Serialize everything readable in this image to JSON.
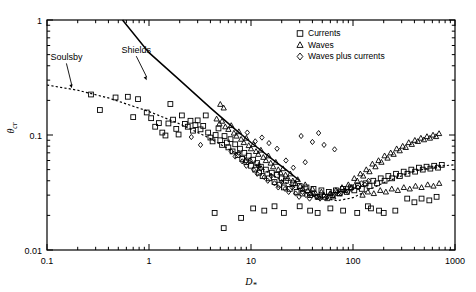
{
  "chart_data": {
    "type": "scatter",
    "title": "",
    "xlabel": "D*",
    "ylabel": "θcr",
    "xscale": "log",
    "yscale": "log",
    "xlim": [
      0.1,
      1000
    ],
    "ylim": [
      0.01,
      1
    ],
    "xticks": [
      "0.1",
      "1",
      "10",
      "100",
      "1000"
    ],
    "yticks": [
      "0.01",
      "0.1",
      "1"
    ],
    "grid": false,
    "legend_position": "top-right",
    "legend": [
      {
        "label": "Currents",
        "marker": "square"
      },
      {
        "label": "Waves",
        "marker": "triangle"
      },
      {
        "label": "Waves plus currents",
        "marker": "diamond"
      }
    ],
    "annotations": [
      {
        "text": "Shields",
        "x": 0.75,
        "y": 0.52,
        "arrow_to_x": 0.95,
        "arrow_to_y": 0.3
      },
      {
        "text": "Soulsby",
        "x": 0.155,
        "y": 0.45,
        "arrow_to_x": 0.175,
        "arrow_to_y": 0.255
      }
    ],
    "curves": [
      {
        "name": "Shields",
        "style": "solid",
        "points": [
          [
            0.55,
            1.0
          ],
          [
            1,
            0.52
          ],
          [
            2,
            0.3
          ],
          [
            4,
            0.172
          ],
          [
            7,
            0.112
          ],
          [
            10,
            0.086
          ],
          [
            16,
            0.062
          ],
          [
            22,
            0.05
          ],
          [
            30,
            0.04
          ]
        ]
      },
      {
        "name": "Soulsby",
        "style": "dotted",
        "points": [
          [
            0.1,
            0.272
          ],
          [
            0.2,
            0.245
          ],
          [
            0.4,
            0.21
          ],
          [
            0.7,
            0.178
          ],
          [
            1,
            0.16
          ],
          [
            2,
            0.125
          ],
          [
            4,
            0.093
          ],
          [
            7,
            0.07
          ],
          [
            10,
            0.059
          ],
          [
            20,
            0.04
          ],
          [
            40,
            0.0295
          ],
          [
            70,
            0.0268
          ],
          [
            100,
            0.0285
          ],
          [
            200,
            0.0385
          ],
          [
            400,
            0.0485
          ],
          [
            700,
            0.0535
          ],
          [
            1000,
            0.0552
          ]
        ]
      }
    ],
    "series": [
      {
        "name": "Currents",
        "marker": "square",
        "points": [
          [
            0.27,
            0.225
          ],
          [
            0.33,
            0.165
          ],
          [
            0.47,
            0.212
          ],
          [
            0.62,
            0.215
          ],
          [
            0.7,
            0.143
          ],
          [
            0.78,
            0.205
          ],
          [
            0.95,
            0.157
          ],
          [
            1.05,
            0.14
          ],
          [
            1.15,
            0.118
          ],
          [
            1.25,
            0.127
          ],
          [
            1.35,
            0.105
          ],
          [
            1.45,
            0.099
          ],
          [
            1.55,
            0.126
          ],
          [
            1.62,
            0.186
          ],
          [
            1.72,
            0.136
          ],
          [
            1.85,
            0.113
          ],
          [
            1.95,
            0.101
          ],
          [
            2.1,
            0.148
          ],
          [
            2.25,
            0.125
          ],
          [
            2.4,
            0.118
          ],
          [
            2.55,
            0.133
          ],
          [
            2.7,
            0.109
          ],
          [
            2.85,
            0.122
          ],
          [
            3.0,
            0.134
          ],
          [
            3.2,
            0.112
          ],
          [
            3.4,
            0.12
          ],
          [
            3.6,
            0.148
          ],
          [
            3.8,
            0.105
          ],
          [
            4.0,
            0.095
          ],
          [
            4.2,
            0.088
          ],
          [
            4.5,
            0.1
          ],
          [
            4.8,
            0.114
          ],
          [
            5.0,
            0.09
          ],
          [
            5.2,
            0.082
          ],
          [
            5.5,
            0.098
          ],
          [
            5.8,
            0.086
          ],
          [
            6.0,
            0.078
          ],
          [
            6.3,
            0.092
          ],
          [
            6.6,
            0.072
          ],
          [
            7.0,
            0.083
          ],
          [
            7.4,
            0.067
          ],
          [
            7.8,
            0.076
          ],
          [
            8.2,
            0.062
          ],
          [
            8.6,
            0.07
          ],
          [
            9.0,
            0.058
          ],
          [
            9.5,
            0.066
          ],
          [
            10,
            0.054
          ],
          [
            10.5,
            0.061
          ],
          [
            11,
            0.05
          ],
          [
            11.5,
            0.057
          ],
          [
            12,
            0.047
          ],
          [
            12.5,
            0.053
          ],
          [
            13,
            0.044
          ],
          [
            14,
            0.05
          ],
          [
            15,
            0.042
          ],
          [
            16,
            0.047
          ],
          [
            17,
            0.039
          ],
          [
            18,
            0.045
          ],
          [
            19,
            0.037
          ],
          [
            20,
            0.042
          ],
          [
            21,
            0.035
          ],
          [
            22,
            0.04
          ],
          [
            24,
            0.034
          ],
          [
            26,
            0.038
          ],
          [
            28,
            0.032
          ],
          [
            30,
            0.036
          ],
          [
            32,
            0.031
          ],
          [
            35,
            0.035
          ],
          [
            38,
            0.03
          ],
          [
            41,
            0.034
          ],
          [
            45,
            0.029
          ],
          [
            49,
            0.033
          ],
          [
            53,
            0.029
          ],
          [
            58,
            0.032
          ],
          [
            63,
            0.03
          ],
          [
            68,
            0.033
          ],
          [
            74,
            0.031
          ],
          [
            80,
            0.034
          ],
          [
            87,
            0.032
          ],
          [
            95,
            0.035
          ],
          [
            103,
            0.033
          ],
          [
            112,
            0.036
          ],
          [
            122,
            0.034
          ],
          [
            133,
            0.038
          ],
          [
            145,
            0.036
          ],
          [
            158,
            0.04
          ],
          [
            172,
            0.038
          ],
          [
            187,
            0.042
          ],
          [
            204,
            0.04
          ],
          [
            222,
            0.044
          ],
          [
            242,
            0.042
          ],
          [
            264,
            0.046
          ],
          [
            288,
            0.044
          ],
          [
            314,
            0.048
          ],
          [
            342,
            0.046
          ],
          [
            373,
            0.05
          ],
          [
            406,
            0.048
          ],
          [
            443,
            0.052
          ],
          [
            483,
            0.05
          ],
          [
            526,
            0.053
          ],
          [
            573,
            0.051
          ],
          [
            625,
            0.054
          ],
          [
            681,
            0.052
          ],
          [
            742,
            0.055
          ],
          [
            4.4,
            0.021
          ],
          [
            8.0,
            0.019
          ],
          [
            10.5,
            0.023
          ],
          [
            13.5,
            0.022
          ],
          [
            17,
            0.024
          ],
          [
            21,
            0.021
          ],
          [
            5.4,
            0.0155
          ],
          [
            60,
            0.023
          ],
          [
            80,
            0.022
          ],
          [
            110,
            0.021
          ],
          [
            150,
            0.023
          ],
          [
            200,
            0.021
          ],
          [
            260,
            0.022
          ],
          [
            340,
            0.028
          ],
          [
            400,
            0.026
          ],
          [
            470,
            0.028
          ],
          [
            560,
            0.027
          ],
          [
            660,
            0.029
          ],
          [
            45,
            0.021
          ],
          [
            30,
            0.024
          ],
          [
            38,
            0.022
          ],
          [
            140,
            0.024
          ],
          [
            180,
            0.022
          ]
        ]
      },
      {
        "name": "Waves",
        "marker": "triangle",
        "points": [
          [
            4.6,
            0.138
          ],
          [
            4.9,
            0.125
          ],
          [
            5.2,
            0.132
          ],
          [
            5.6,
            0.118
          ],
          [
            6.0,
            0.112
          ],
          [
            6.4,
            0.121
          ],
          [
            6.8,
            0.104
          ],
          [
            7.2,
            0.098
          ],
          [
            7.6,
            0.107
          ],
          [
            8.0,
            0.092
          ],
          [
            8.5,
            0.086
          ],
          [
            9.0,
            0.094
          ],
          [
            9.5,
            0.081
          ],
          [
            10,
            0.076
          ],
          [
            10.6,
            0.083
          ],
          [
            11.2,
            0.072
          ],
          [
            11.8,
            0.068
          ],
          [
            12.5,
            0.074
          ],
          [
            13.2,
            0.064
          ],
          [
            14,
            0.06
          ],
          [
            14.8,
            0.066
          ],
          [
            15.6,
            0.057
          ],
          [
            16.5,
            0.053
          ],
          [
            17.5,
            0.058
          ],
          [
            18.5,
            0.05
          ],
          [
            19.5,
            0.047
          ],
          [
            20.6,
            0.051
          ],
          [
            21.8,
            0.045
          ],
          [
            23,
            0.042
          ],
          [
            24.3,
            0.046
          ],
          [
            25.7,
            0.04
          ],
          [
            27.2,
            0.038
          ],
          [
            28.7,
            0.041
          ],
          [
            30.3,
            0.036
          ],
          [
            32,
            0.034
          ],
          [
            34,
            0.037
          ],
          [
            36,
            0.033
          ],
          [
            38,
            0.031
          ],
          [
            40,
            0.034
          ],
          [
            43,
            0.031
          ],
          [
            46,
            0.029
          ],
          [
            49,
            0.032
          ],
          [
            52,
            0.03
          ],
          [
            56,
            0.028
          ],
          [
            60,
            0.031
          ],
          [
            64,
            0.029
          ],
          [
            68,
            0.033
          ],
          [
            73,
            0.031
          ],
          [
            78,
            0.035
          ],
          [
            84,
            0.033
          ],
          [
            90,
            0.037
          ],
          [
            96,
            0.035
          ],
          [
            103,
            0.042
          ],
          [
            110,
            0.04
          ],
          [
            118,
            0.046
          ],
          [
            126,
            0.044
          ],
          [
            135,
            0.05
          ],
          [
            145,
            0.048
          ],
          [
            155,
            0.056
          ],
          [
            166,
            0.053
          ],
          [
            178,
            0.06
          ],
          [
            190,
            0.058
          ],
          [
            204,
            0.066
          ],
          [
            218,
            0.063
          ],
          [
            234,
            0.07
          ],
          [
            250,
            0.068
          ],
          [
            268,
            0.076
          ],
          [
            287,
            0.073
          ],
          [
            307,
            0.08
          ],
          [
            329,
            0.078
          ],
          [
            352,
            0.086
          ],
          [
            377,
            0.083
          ],
          [
            404,
            0.09
          ],
          [
            432,
            0.088
          ],
          [
            463,
            0.094
          ],
          [
            496,
            0.091
          ],
          [
            531,
            0.097
          ],
          [
            568,
            0.094
          ],
          [
            609,
            0.1
          ],
          [
            652,
            0.097
          ],
          [
            698,
            0.103
          ],
          [
            124,
            0.03
          ],
          [
            140,
            0.032
          ],
          [
            160,
            0.031
          ],
          [
            185,
            0.033
          ],
          [
            210,
            0.032
          ],
          [
            240,
            0.034
          ],
          [
            275,
            0.033
          ],
          [
            315,
            0.035
          ],
          [
            360,
            0.034
          ],
          [
            410,
            0.036
          ],
          [
            470,
            0.035
          ],
          [
            540,
            0.037
          ],
          [
            615,
            0.036
          ],
          [
            700,
            0.038
          ],
          [
            5.0,
            0.185
          ],
          [
            5.4,
            0.172
          ],
          [
            8.8,
            0.06
          ],
          [
            12,
            0.055
          ]
        ]
      },
      {
        "name": "Waves plus currents",
        "marker": "diamond",
        "points": [
          [
            6.4,
            0.072
          ],
          [
            7.0,
            0.065
          ],
          [
            7.6,
            0.07
          ],
          [
            8.2,
            0.059
          ],
          [
            9.0,
            0.054
          ],
          [
            9.8,
            0.06
          ],
          [
            10.6,
            0.05
          ],
          [
            11.5,
            0.046
          ],
          [
            12.5,
            0.051
          ],
          [
            13.5,
            0.043
          ],
          [
            14.6,
            0.04
          ],
          [
            15.8,
            0.044
          ],
          [
            17,
            0.038
          ],
          [
            18.5,
            0.035
          ],
          [
            20,
            0.039
          ],
          [
            21.6,
            0.034
          ],
          [
            23.4,
            0.032
          ],
          [
            25.3,
            0.035
          ],
          [
            27.4,
            0.031
          ],
          [
            29.6,
            0.029
          ],
          [
            32,
            0.032
          ],
          [
            34.6,
            0.03
          ],
          [
            37.5,
            0.028
          ],
          [
            40.5,
            0.031
          ],
          [
            44,
            0.029
          ],
          [
            47.5,
            0.028
          ],
          [
            51.5,
            0.03
          ],
          [
            55.5,
            0.029
          ],
          [
            60,
            0.031
          ],
          [
            65,
            0.03
          ],
          [
            70,
            0.032
          ],
          [
            76,
            0.031
          ],
          [
            82,
            0.033
          ],
          [
            89,
            0.032
          ],
          [
            96,
            0.034
          ],
          [
            104,
            0.036
          ],
          [
            112,
            0.035
          ],
          [
            121,
            0.038
          ],
          [
            131,
            0.037
          ],
          [
            142,
            0.04
          ],
          [
            31,
            0.098
          ],
          [
            40,
            0.087
          ],
          [
            52,
            0.082
          ],
          [
            46,
            0.104
          ],
          [
            66,
            0.075
          ],
          [
            22,
            0.06
          ],
          [
            26,
            0.052
          ],
          [
            18,
            0.076
          ],
          [
            15,
            0.085
          ],
          [
            2.6,
            0.096
          ],
          [
            3.2,
            0.082
          ],
          [
            12.8,
            0.095
          ],
          [
            34,
            0.058
          ],
          [
            9.2,
            0.105
          ],
          [
            11,
            0.088
          ]
        ]
      }
    ]
  }
}
